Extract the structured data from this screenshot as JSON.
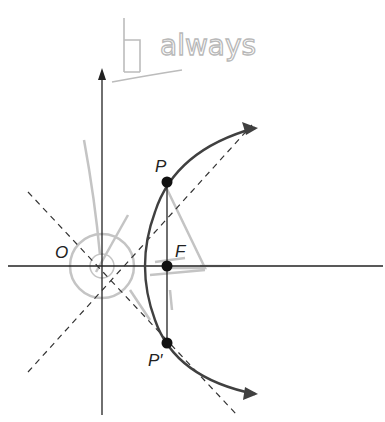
{
  "annotation": {
    "text": "always",
    "prefix_glyph": "Ⅱ"
  },
  "labels": {
    "origin": "O",
    "focus": "F",
    "point_p": "P",
    "point_p_prime": "P′"
  },
  "colors": {
    "ink": "#222222",
    "curve": "#404040",
    "pencil": "#bdbdbd",
    "background": "#ffffff"
  }
}
